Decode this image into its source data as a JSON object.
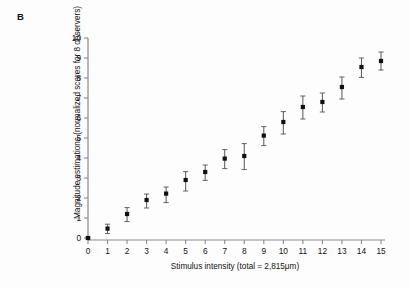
{
  "panel": {
    "label": "B"
  },
  "chart_data": {
    "type": "scatter",
    "title": "",
    "xlabel": "Stimulus intensity (total = 2,815μm)",
    "ylabel": "Magnitude estimations (normalized scores for 8 observers)",
    "x": [
      0,
      1,
      2,
      3,
      4,
      5,
      6,
      7,
      8,
      9,
      10,
      11,
      12,
      13,
      14,
      15
    ],
    "values": [
      0.0,
      0.47,
      1.2,
      1.9,
      2.22,
      2.9,
      3.3,
      3.97,
      4.1,
      5.12,
      5.8,
      6.55,
      6.8,
      7.55,
      8.55,
      8.85
    ],
    "yerr_lower": [
      0.05,
      0.25,
      0.38,
      0.4,
      0.45,
      0.55,
      0.42,
      0.5,
      0.68,
      0.5,
      0.6,
      0.6,
      0.5,
      0.6,
      0.52,
      0.45
    ],
    "yerr_upper": [
      0.05,
      0.22,
      0.32,
      0.3,
      0.33,
      0.42,
      0.35,
      0.45,
      0.62,
      0.45,
      0.52,
      0.55,
      0.45,
      0.5,
      0.45,
      0.45
    ],
    "xlim": [
      0,
      15
    ],
    "ylim": [
      0,
      10
    ],
    "xticks": [
      "0",
      "1",
      "2",
      "3",
      "4",
      "5",
      "6",
      "7",
      "8",
      "9",
      "10",
      "11",
      "12",
      "13",
      "14",
      "15"
    ],
    "yticks": [
      "0",
      "1",
      "2",
      "3",
      "4",
      "5",
      "6",
      "7",
      "8",
      "9",
      "10"
    ],
    "grid": false,
    "legend": "none",
    "marker": "filled-square",
    "marker_color": "#111111",
    "errorbar_color": "#555555",
    "axis_color": "#8a8a8a"
  }
}
